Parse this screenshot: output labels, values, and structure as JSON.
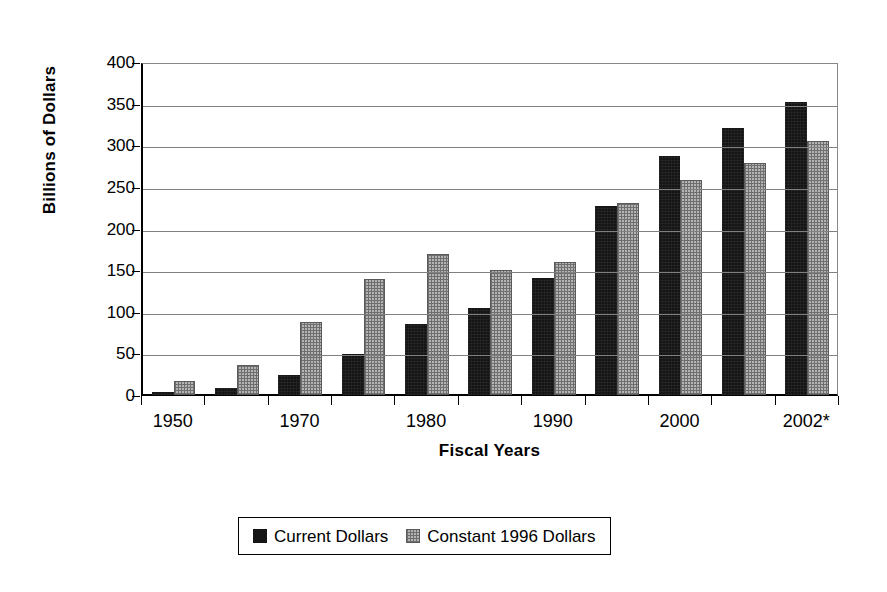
{
  "chart_data": {
    "type": "bar",
    "title": "",
    "xlabel": "Fiscal Years",
    "ylabel": "Billions of Dollars",
    "ylim": [
      0,
      400
    ],
    "ytick_step": 50,
    "yticks": [
      0,
      50,
      100,
      150,
      200,
      250,
      300,
      350,
      400
    ],
    "grid": true,
    "legend_position": "bottom-center",
    "categories": [
      "1950",
      "1960",
      "1970",
      "1975",
      "1980",
      "1985",
      "1990",
      "1995",
      "2000",
      "2001",
      "2002*"
    ],
    "visible_tick_labels": [
      "1950",
      "",
      "1970",
      "",
      "1980",
      "",
      "1990",
      "",
      "2000",
      "",
      "2002*"
    ],
    "series": [
      {
        "name": "Current Dollars",
        "color": "#151515",
        "values": [
          6,
          11,
          26,
          52,
          88,
          107,
          143,
          229,
          290,
          323,
          354
        ]
      },
      {
        "name": "Constant 1996 Dollars",
        "color": "#b4b4b4",
        "values": [
          19,
          39,
          90,
          142,
          172,
          152,
          162,
          233,
          261,
          281,
          308
        ]
      }
    ]
  },
  "axis": {
    "y_title": "Billions of Dollars",
    "x_title": "Fiscal Years",
    "y_tick_labels": [
      "400",
      "350",
      "300",
      "250",
      "200",
      "150",
      "100",
      "50",
      "0"
    ],
    "x_tick_labels": [
      "1950",
      "1970",
      "1980",
      "1990",
      "2000",
      "2002*"
    ]
  },
  "legend": {
    "items": [
      {
        "label": "Current Dollars",
        "swatch": "black-solid-swatch"
      },
      {
        "label": "Constant 1996 Dollars",
        "swatch": "gray-crosshatch-swatch"
      }
    ]
  }
}
